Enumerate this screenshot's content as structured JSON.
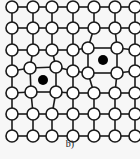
{
  "figure": {
    "caption": "b)",
    "colors": {
      "line": "#1a1a1a",
      "node_fill": "#ffffff",
      "vacancy": "#000000",
      "background": "#f7f7f7"
    },
    "node_radius": 6,
    "rows_y": [
      7,
      28,
      50,
      71,
      93,
      114,
      136
    ],
    "cols_x": [
      12,
      33,
      52,
      73,
      94,
      115,
      135
    ],
    "displaced_nodes": [
      {
        "row": 2,
        "col": 4,
        "x": 88,
        "y": 48
      },
      {
        "row": 2,
        "col": 5,
        "x": 117,
        "y": 48
      },
      {
        "row": 3,
        "col": 4,
        "x": 88,
        "y": 73
      },
      {
        "row": 3,
        "col": 5,
        "x": 117,
        "y": 73
      },
      {
        "row": 3,
        "col": 1,
        "x": 30,
        "y": 68
      },
      {
        "row": 3,
        "col": 2,
        "x": 56,
        "y": 67
      },
      {
        "row": 4,
        "col": 1,
        "x": 31,
        "y": 92
      },
      {
        "row": 4,
        "col": 2,
        "x": 56,
        "y": 92
      }
    ],
    "vacancies": [
      {
        "x": 103,
        "y": 60,
        "r": 5
      },
      {
        "x": 43,
        "y": 80,
        "r": 5
      }
    ]
  }
}
